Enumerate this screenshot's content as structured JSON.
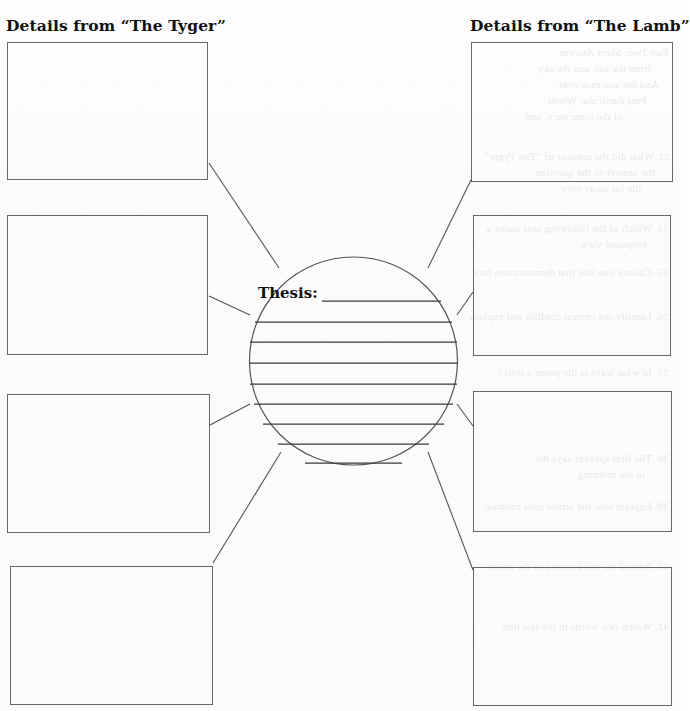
{
  "page": {
    "type": "graphic-organizer-worksheet",
    "paper_color": "#fcfcfc",
    "ink_color": "#333333",
    "box_border_color": "#676767"
  },
  "headings": {
    "left": "Details from “The Tyger”",
    "right": "Details from “The Lamb”"
  },
  "center": {
    "thesis_label": "Thesis:",
    "shape": "circle",
    "writing_line_count": 9
  },
  "left_boxes": [
    {
      "label": ""
    },
    {
      "label": ""
    },
    {
      "label": ""
    },
    {
      "label": ""
    }
  ],
  "right_boxes": [
    {
      "label": ""
    },
    {
      "label": ""
    },
    {
      "label": ""
    },
    {
      "label": ""
    }
  ],
  "bleed_through_text": [
    "Part Two: Short Answer",
    "from the sun and the sky",
    "And the sun rose over",
    "Post Particular Words",
    "of the innocence, and",
    "33. What did the speaker of “The Tyger”",
    "the answer to the question",
    "the far away view",
    "34. Which of the following best states a",
    "proposed view",
    "35. Choose one line that demonstrates how",
    "36. Identify the central conflict and explain",
    "37. In what ways is the poem a lyric?",
    "38. The first speaker says the",
    "in the morning",
    "39. Explain how the writer uses contrast",
    "40. Reread the third stanza of the poem",
    "41. Which two words in the last line"
  ]
}
